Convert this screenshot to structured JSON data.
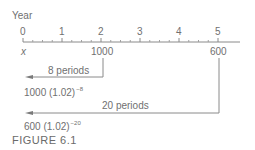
{
  "axis": {
    "label": "Year",
    "ticks": [
      "0",
      "1",
      "2",
      "3",
      "4",
      "5"
    ],
    "origin_label": "x"
  },
  "payments": [
    {
      "year": 2,
      "amount": "1000"
    },
    {
      "year": 5,
      "amount": "600"
    }
  ],
  "arrows": [
    {
      "label": "8 periods",
      "result_base": "1000 (1.02)",
      "result_exp": "−8"
    },
    {
      "label": "20 periods",
      "result_base": "600 (1.02)",
      "result_exp": "−20"
    }
  ],
  "caption": "FIGURE 6.1",
  "colors": {
    "line": "#8a8a8a",
    "text": "#707070"
  }
}
